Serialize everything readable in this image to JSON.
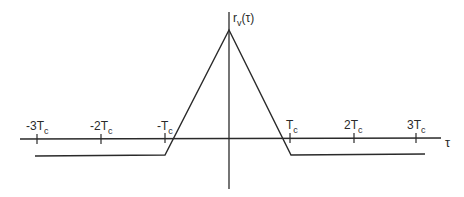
{
  "diagram": {
    "type": "autocorrelation-triangle",
    "y_axis_label": {
      "main": "r",
      "sub": "v",
      "arg": "(τ)"
    },
    "x_axis_label": "τ",
    "ticks": [
      {
        "coef": "-3",
        "sym": "T",
        "sub": "c",
        "x": 37
      },
      {
        "coef": "-2",
        "sym": "T",
        "sub": "c",
        "x": 101
      },
      {
        "coef": "-",
        "sym": "T",
        "sub": "c",
        "x": 165
      },
      {
        "coef": "",
        "sym": "T",
        "sub": "c",
        "x": 290
      },
      {
        "coef": "2",
        "sym": "T",
        "sub": "c",
        "x": 354
      },
      {
        "coef": "3",
        "sym": "T",
        "sub": "c",
        "x": 416
      }
    ],
    "colors": {
      "line": "#2a2a2a",
      "background": "#ffffff"
    }
  }
}
